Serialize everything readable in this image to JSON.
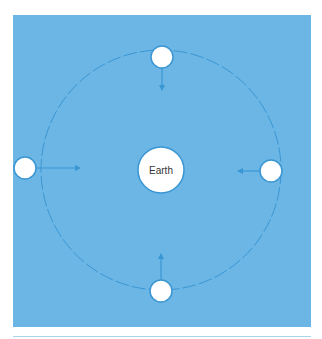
{
  "diagram": {
    "title": "",
    "center_label": "Earth",
    "colors": {
      "background": "#6cb6e6",
      "orbit_line": "#3a96d2",
      "arrow": "#3a96d2",
      "body_fill": "#ffffff",
      "body_stroke": "#3a96d2",
      "text": "#333333"
    },
    "orbit": {
      "cx": 161,
      "cy": 170,
      "r": 120,
      "style": "dashed"
    },
    "earth": {
      "cx": 161,
      "cy": 170,
      "r": 23
    },
    "satellites": [
      {
        "position": "top",
        "cx": 162,
        "cy": 57,
        "r": 11,
        "arrow_direction": "down"
      },
      {
        "position": "left",
        "cx": 25,
        "cy": 168,
        "r": 11,
        "arrow_direction": "right"
      },
      {
        "position": "right",
        "cx": 271,
        "cy": 171,
        "r": 11,
        "arrow_direction": "left"
      },
      {
        "position": "bottom",
        "cx": 161,
        "cy": 291,
        "r": 11,
        "arrow_direction": "up"
      }
    ],
    "arrows_point_toward": "Earth"
  }
}
